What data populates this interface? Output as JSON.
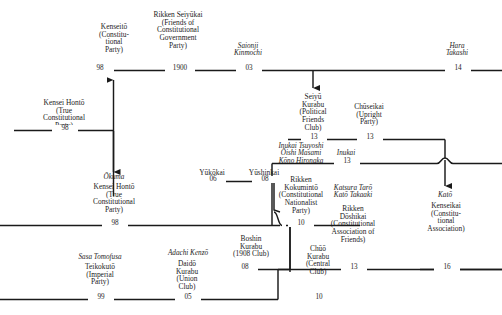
{
  "diagram": {
    "type": "genealogy-flow",
    "line_color": "#1a1a1a",
    "text_color": "#1c1c1c",
    "background": "#ffffff"
  },
  "nodes": [
    {
      "id": "kenseito",
      "leader": "",
      "name": "Kenseiō\n(Constitu-\ntional\nParty)",
      "year": "98"
    },
    {
      "id": "rikken-seiyukai",
      "leader": "",
      "name": "Rikken Seiyūkai\n(Friends of\nConstitutional\nGovernment\nParty)",
      "year": "1900"
    },
    {
      "id": "saionji",
      "leader": "Saionji\nKinmochi",
      "name": "",
      "year": "03"
    },
    {
      "id": "hara",
      "leader": "Hara\nTakashi",
      "name": "",
      "year": "14"
    },
    {
      "id": "kensei-honto-top",
      "leader": "",
      "name": "Kensei Hontō\n(True\nConstitutional\nParty)",
      "year": "98"
    },
    {
      "id": "seiyu-kurabu",
      "leader": "",
      "name": "Seiyū\nKurabu\n(Political\nFriends\nClub)",
      "year": "13"
    },
    {
      "id": "chuseikai",
      "leader": "",
      "name": "Chūseikai\n(Upright\nParty)",
      "year": "13"
    },
    {
      "id": "okuma",
      "leader": "Ōkuma",
      "name": "Kensei Hontō\n(True\nConstitutional\nParty)",
      "year": "98"
    },
    {
      "id": "yukokai",
      "leader": "",
      "name": "Yūkōkai",
      "year": "06"
    },
    {
      "id": "yushinkai",
      "leader": "",
      "name": "Yūshinkai",
      "year": "08"
    },
    {
      "id": "rikken-kokuminto",
      "leader": "Inukai Tsuyoshi\nŌishi Masami\nKōno Hironaka",
      "name": "Rikken\nKokumintō\n(Constitutional\nNationalist\nParty)",
      "year": "10"
    },
    {
      "id": "inukai",
      "leader": "Inukai",
      "name": "",
      "year": "13"
    },
    {
      "id": "rikken-doshikai",
      "leader": "Katsura Tarō\nKatō Takaaki",
      "name": "Rikken\nDōshikai\n(Constitutional\nAssociation of\nFriends)",
      "year": "13"
    },
    {
      "id": "kenseikai",
      "leader": "Katō",
      "name": "Kenseikai\n(Constitu-\ntional\nAssociation)",
      "year": "16"
    },
    {
      "id": "teikokuto",
      "leader": "Sasa Tomofusa",
      "name": "Teikokutō\n(Imperial\nParty)",
      "year": "99"
    },
    {
      "id": "daido-kurabu",
      "leader": "Adachi Kenzō",
      "name": "Daidō\nKurabu\n(Union\nClub)",
      "year": "05"
    },
    {
      "id": "boshin-kurabu",
      "leader": "",
      "name": "Boshin\nKurabu\n(1908 Club)",
      "year": "08"
    },
    {
      "id": "chuo-kurabu",
      "leader": "",
      "name": "Chūō\nKurabu\n(Central\nClub)",
      "year": "10"
    }
  ]
}
